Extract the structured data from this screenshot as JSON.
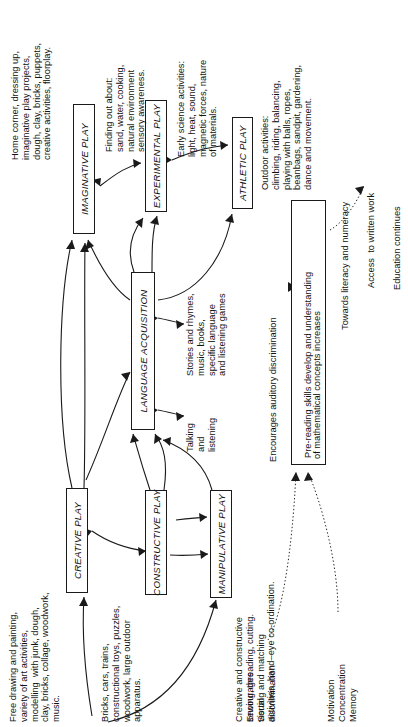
{
  "diagram": {
    "orientation": "rotated-90-counterclockwise",
    "boxes": {
      "imaginative": "IMAGINATIVE PLAY",
      "experimental": "EXPERIMENTAL PLAY",
      "athletic": "ATHLETIC PLAY",
      "language": "LANGUAGE ACQUISITION",
      "creative": "CREATIVE PLAY",
      "constructive": "CONSTRUCTIVE PLAY",
      "manipulative": "MANIPULATIVE PLAY",
      "prereading_line1": "Pre-reading skills develop and understanding",
      "prereading_line2": "of mathematical concepts increases"
    },
    "notes": {
      "imaginative_note": "Home corner, dressing up,\nimaginative play projects,\ndough, clay, bricks, puppets,\ncreative activities, floorplay.",
      "experimental_note": "Finding out about:\nsand, water, cooking,\nnatural environment\nsensory awareness.",
      "athletic_note_science": "Early science activities:\nlight, heat, sound,\nmagnetic forces, nature\nof materials.",
      "outdoor_note": "Outdoor activities:\nclimbing, riding, balancing,\nplaying with balls, ropes,\nbeanbags, sandpit, gardening,\ndance and movement.",
      "language_note": "Stories and rhymes,\nmusic, books,\nspecific language\nand listening games",
      "talking_note": "Talking\nand\nlistening",
      "creative_note": "Free drawing and painting,\nvariety of art activities,\nmodelling  with junk, dough,\nclay, bricks, collage, woodwork,\nmusic.",
      "constructive_note": "Bricks, cars, trains,\nconstructional toys, puzzles,\nwoodwork, large outdoor\napparatus.",
      "manipulative_note": "Creative and constructive\nsewing, threading, cutting.\nSorting and matching\nactivities, hand–eye co-ordination.",
      "auditory_note": "Encourages auditory discrimination",
      "visual_note": "Encourages\nvisual\ndiscrimination",
      "motivation_note": "Motivation\nConcentration\nMemory",
      "literacy_note": "Towards literacy and numeracy",
      "written_work_note": "Access  to written work",
      "education_note": "Education continues"
    },
    "colors": {
      "ink": "#1a1a1a",
      "background": "#ffffff"
    }
  }
}
